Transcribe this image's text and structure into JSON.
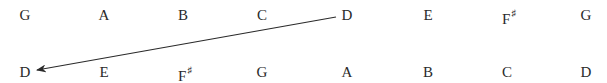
{
  "diagram": {
    "top_row": [
      {
        "note": "G",
        "acc": ""
      },
      {
        "note": "A",
        "acc": ""
      },
      {
        "note": "B",
        "acc": ""
      },
      {
        "note": "C",
        "acc": ""
      },
      {
        "note": "D",
        "acc": ""
      },
      {
        "note": "E",
        "acc": ""
      },
      {
        "note": "F",
        "acc": "♯"
      },
      {
        "note": "G",
        "acc": ""
      }
    ],
    "bottom_row": [
      {
        "note": "D",
        "acc": ""
      },
      {
        "note": "E",
        "acc": ""
      },
      {
        "note": "F",
        "acc": "♯"
      },
      {
        "note": "G",
        "acc": ""
      },
      {
        "note": "A",
        "acc": ""
      },
      {
        "note": "B",
        "acc": ""
      },
      {
        "note": "C",
        "acc": ""
      },
      {
        "note": "D",
        "acc": ""
      }
    ],
    "arrow": {
      "from": "top_row.D",
      "to": "bottom_row.D",
      "color": "#2a2a2a"
    }
  }
}
